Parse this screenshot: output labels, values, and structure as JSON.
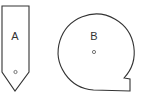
{
  "diagram": {
    "shapes": [
      {
        "id": "A",
        "label": "A",
        "type": "pentagon-arrow"
      },
      {
        "id": "B",
        "label": "B",
        "type": "circle-with-notch"
      }
    ],
    "stroke_color": "#333333",
    "background": "#ffffff"
  }
}
